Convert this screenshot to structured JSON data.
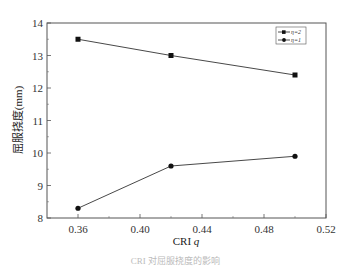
{
  "chart_data": {
    "type": "line",
    "title": "",
    "xlabel": "CRI q",
    "xlabel_main": "CRI",
    "xlabel_var": "q",
    "ylabel": "屈服挠度(mm)",
    "xlim": [
      0.34,
      0.52
    ],
    "ylim": [
      8,
      14
    ],
    "x_ticks": [
      "0.36",
      "0.40",
      "0.44",
      "0.48",
      "0.52"
    ],
    "y_ticks": [
      "8",
      "9",
      "10",
      "11",
      "12",
      "13",
      "14"
    ],
    "grid": false,
    "legend_position": "upper right",
    "x": [
      0.36,
      0.42,
      0.5
    ],
    "series": [
      {
        "name": "η=2",
        "marker": "square",
        "values": [
          13.5,
          13.0,
          12.4
        ]
      },
      {
        "name": "η=1",
        "marker": "circle",
        "values": [
          8.3,
          9.6,
          9.9
        ]
      }
    ],
    "caption": "CRI 对屈服挠度的影响"
  }
}
